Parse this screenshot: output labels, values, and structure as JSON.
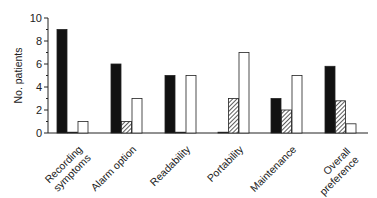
{
  "chart_data": {
    "type": "bar",
    "title": "",
    "xlabel": "",
    "ylabel": "No. patients",
    "ylim": [
      0,
      10
    ],
    "yticks": [
      0,
      2,
      4,
      6,
      8,
      10
    ],
    "grid": false,
    "legend": "none",
    "categories": [
      "Recording symptoms",
      "Alarm option",
      "Readability",
      "Portability",
      "Maintenance",
      "Overall preference"
    ],
    "category_lines": [
      [
        "Recording",
        "symptoms"
      ],
      [
        "Alarm option"
      ],
      [
        "Readability"
      ],
      [
        "Portability"
      ],
      [
        "Maintenance"
      ],
      [
        "Overall",
        "preference"
      ]
    ],
    "series": [
      {
        "name": "series-black",
        "fill": "#111111",
        "values": [
          9,
          6,
          5,
          0,
          3,
          5.8
        ]
      },
      {
        "name": "series-hatched",
        "fill": "hatch",
        "values": [
          0,
          1,
          0,
          3,
          2,
          2.8
        ]
      },
      {
        "name": "series-white",
        "fill": "#ffffff",
        "values": [
          1,
          3,
          5,
          7,
          5,
          0.8
        ]
      }
    ]
  }
}
